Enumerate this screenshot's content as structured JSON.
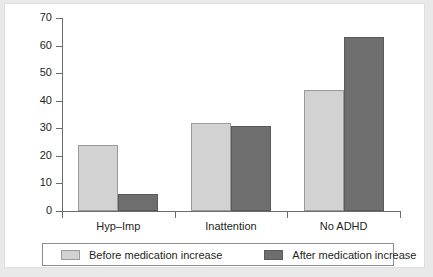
{
  "chart_data": {
    "type": "bar",
    "title": "",
    "subtitle": "",
    "xlabel": "",
    "ylabel": "",
    "categories": [
      "Hyp–Imp",
      "Inattention",
      "No ADHD"
    ],
    "series": [
      {
        "name": "Before medication increase",
        "color": "#d2d2d2",
        "values": [
          24,
          32,
          44
        ]
      },
      {
        "name": "After medication increase",
        "color": "#6e6e6e",
        "values": [
          6,
          31,
          63
        ]
      }
    ],
    "ylim": [
      0,
      70
    ],
    "yticks": [
      0,
      10,
      20,
      30,
      40,
      50,
      60,
      70
    ],
    "ytick_labels": [
      "0",
      "10",
      "20",
      "30",
      "40",
      "50",
      "60",
      "70"
    ],
    "grid": false,
    "legend_position": "bottom",
    "axis_color": "#6b6b6b",
    "text_color": "#231f20",
    "background": "#ffffff",
    "frame_color": "#e9e9e9"
  },
  "legend": {
    "entries": [
      {
        "label": "Before medication increase",
        "swatch": "light"
      },
      {
        "label": "After medication increase",
        "swatch": "dark"
      }
    ]
  }
}
